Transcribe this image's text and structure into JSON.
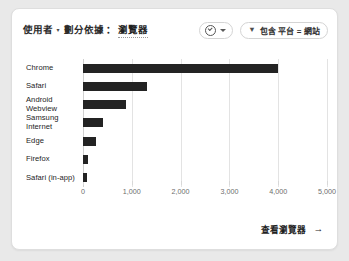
{
  "card": {
    "header": {
      "title_main": "使用者",
      "title_caret": "▾",
      "title_sub": "劃分依據",
      "title_colon": "：",
      "title_dimension": "瀏覽器",
      "metric_selector": {
        "icon": "circle-check-icon",
        "caret": "chevron-down-icon"
      },
      "filter_chip": {
        "icon": "filter-icon",
        "glyph": "▼",
        "label": "包含 平台 = 網站"
      }
    },
    "footer": {
      "link_label": "查看瀏覽器",
      "arrow": "→"
    }
  },
  "chart_data": {
    "type": "bar",
    "orientation": "horizontal",
    "xlabel": "",
    "ylabel": "",
    "categories": [
      "Chrome",
      "Safari",
      "Android\nWebview",
      "Samsung\nInternet",
      "Edge",
      "Firefox",
      "Safari (in-app)"
    ],
    "values": [
      4000,
      1320,
      880,
      400,
      260,
      100,
      80
    ],
    "xlim": [
      0,
      5000
    ],
    "xticks": [
      0,
      1000,
      2000,
      3000,
      4000,
      5000
    ],
    "xticklabels": [
      "0",
      "1,000",
      "2,000",
      "3,000",
      "4,000",
      "5,000"
    ],
    "grid": true,
    "legend": false,
    "bar_color": "#232323"
  }
}
